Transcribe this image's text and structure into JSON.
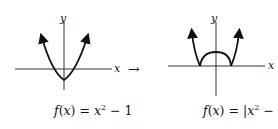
{
  "left_graph": {
    "y_label": "y",
    "x_label": "x",
    "formula": {
      "f": "f",
      "paren_open": "(",
      "var": "x",
      "paren_close": ")",
      "eq": " = ",
      "base": "x",
      "exp": "2",
      "rest": " − 1"
    }
  },
  "transform_arrow": "→",
  "right_graph": {
    "y_label": "y",
    "x_label": "x",
    "formula": {
      "f": "f",
      "paren_open": "(",
      "var": "x",
      "paren_close": ")",
      "eq": " = ",
      "bar_open": "|",
      "base": "x",
      "exp": "2",
      "rest": " − 1",
      "bar_close": "|"
    }
  },
  "colors": {
    "stroke": "#111111",
    "background": "#ffffff"
  }
}
